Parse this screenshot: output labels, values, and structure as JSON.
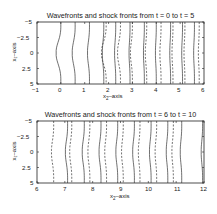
{
  "chart_data": [
    {
      "type": "line",
      "title": "Wavefronts and shock fronts from t = 0 to t = 5",
      "xlabel": "x2-axis",
      "ylabel": "x1-axis",
      "xlim": [
        -1,
        6
      ],
      "ylim": [
        5,
        -5
      ],
      "x_ticks": [
        "-1",
        "0",
        "1",
        "2",
        "3",
        "4",
        "5",
        "6"
      ],
      "y_ticks": [
        "-5",
        "-2.5",
        "0",
        "2.5",
        "5"
      ],
      "grid": false,
      "legend": null,
      "series": [
        {
          "name": "wavefronts",
          "style": "solid",
          "description": "curved fronts bulging toward negative x2 near x1=0, flattening over time",
          "x_positions_at_edges": [
            0.0,
            0.6,
            1.2,
            1.8,
            2.3,
            2.9,
            3.5,
            4.0,
            4.6,
            5.1,
            5.6
          ]
        },
        {
          "name": "shock fronts",
          "style": "dashed",
          "description": "dashed fronts trailing wavefronts",
          "x_positions_at_edges": [
            1.9,
            2.5,
            3.0,
            3.6,
            4.2,
            4.7,
            5.2,
            5.8
          ]
        }
      ]
    },
    {
      "type": "line",
      "title": "Wavefronts and shock fronts from t = 6 to t = 10",
      "xlabel": "x2-axis",
      "ylabel": "x1-axis",
      "xlim": [
        6,
        12
      ],
      "ylim": [
        5,
        -5
      ],
      "x_ticks": [
        "6",
        "7",
        "8",
        "9",
        "10",
        "11",
        "12"
      ],
      "y_ticks": [
        "-5",
        "-2.5",
        "0",
        "2.5",
        "5"
      ],
      "grid": false,
      "legend": null,
      "series": [
        {
          "name": "wavefronts",
          "style": "solid",
          "x_positions_at_edges": [
            7.1,
            7.7,
            8.3,
            8.9,
            9.5,
            10.1,
            10.7,
            11.2,
            11.95
          ]
        },
        {
          "name": "shock fronts",
          "style": "dashed",
          "x_positions_at_edges": [
            6.6,
            7.25,
            7.9,
            8.5,
            9.1,
            9.7,
            10.3,
            10.9
          ]
        }
      ]
    }
  ],
  "top": {
    "title": "Wavefronts and shock fronts from t = 0 to t = 5",
    "xlabel_main": "x",
    "xlabel_sub": "2",
    "xlabel_rest": "–axis",
    "ylabel": "x₁–axis",
    "x_ticks": [
      "−1",
      "0",
      "1",
      "2",
      "3",
      "4",
      "5",
      "6"
    ],
    "y_ticks": [
      "−5",
      "−2.5",
      "0",
      "2.5",
      "5"
    ]
  },
  "bottom": {
    "title": "Wavefronts and shock fronts from t = 6 to t = 10",
    "xlabel_main": "x",
    "xlabel_sub": "2",
    "xlabel_rest": "–axis",
    "ylabel": "x₁–axis",
    "x_ticks": [
      "6",
      "7",
      "8",
      "9",
      "10",
      "11",
      "12"
    ],
    "y_ticks": [
      "−5",
      "−2.5",
      "0",
      "2.5",
      "5"
    ]
  }
}
